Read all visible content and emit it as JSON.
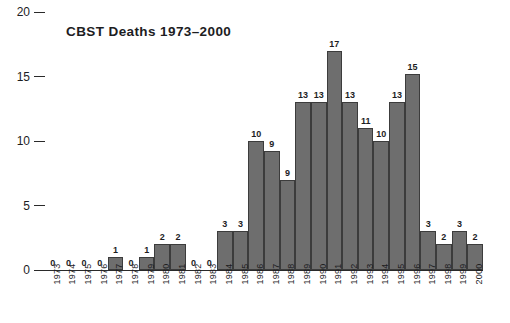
{
  "chart_data": {
    "type": "bar",
    "title": "CBST Deaths 1973–2000",
    "xlabel": "",
    "ylabel": "",
    "ylim": [
      0,
      20
    ],
    "yticks": [
      0,
      5,
      10,
      15,
      20
    ],
    "grid": false,
    "legend": false,
    "categories": [
      "1973",
      "1974",
      "1975",
      "1976",
      "1977",
      "1978",
      "1979",
      "1980",
      "1981",
      "1982",
      "1983",
      "1984",
      "1985",
      "1986",
      "1987",
      "1988",
      "1989",
      "1990",
      "1991",
      "1992",
      "1993",
      "1994",
      "1995",
      "1996",
      "1997",
      "1998",
      "1999",
      "2000"
    ],
    "values": [
      0,
      0,
      0,
      0,
      1,
      0,
      1,
      2,
      2,
      0,
      0,
      3,
      3,
      10,
      9,
      9,
      13,
      13,
      17,
      13,
      11,
      10,
      13,
      15,
      3,
      2,
      3,
      2
    ],
    "drawn_heights": [
      0,
      0,
      0,
      0,
      1,
      0,
      1,
      2,
      2,
      0,
      0,
      3,
      3,
      10,
      9.2,
      7,
      13,
      13,
      17,
      13,
      11,
      10,
      13,
      15.2,
      3,
      2,
      3,
      2
    ],
    "bar_color": "#6e6e6e",
    "bar_edge_color": "#3c3c3c",
    "text_color": "#1d1d1f",
    "background": "#ffffff"
  }
}
